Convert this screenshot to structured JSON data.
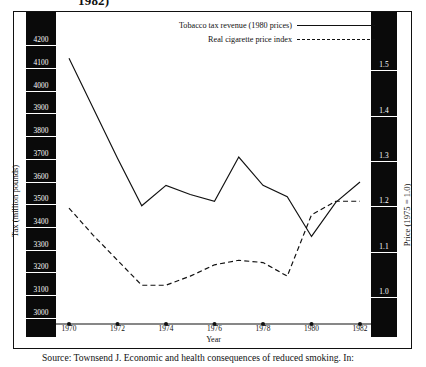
{
  "figure": {
    "title_fragment": "1982)",
    "source": "Source: Townsend J. Economic and health consequences of reduced smoking. In:"
  },
  "legend": {
    "position": "top-center",
    "entries": [
      {
        "label": "Tobacco tax revenue (1980 prices)",
        "style": "solid"
      },
      {
        "label": "Real cigarette price index",
        "style": "dashed"
      }
    ]
  },
  "axes": {
    "x": {
      "label": "Year",
      "ticks": [
        "1970",
        "1972",
        "1974",
        "1976",
        "1978",
        "1980",
        "1982"
      ],
      "min": 1970,
      "max": 1982
    },
    "y_left": {
      "label": "Tax (million pounds)",
      "ticks": [
        "4200",
        "4100",
        "4000",
        "3900",
        "3800",
        "3700",
        "3600",
        "3500",
        "3400",
        "3300",
        "3200",
        "3100",
        "3000"
      ],
      "min": 2950,
      "max": 4250
    },
    "y_right": {
      "label": "Price (1975 = 1.0)",
      "ticks": [
        "1.5",
        "1.4",
        "1.3",
        "1.2",
        "1.1",
        "1.0"
      ],
      "min": 0.93,
      "max": 1.58
    }
  },
  "chart_data": {
    "type": "line",
    "xlabel": "Year",
    "ylabel": "Tax (million pounds)",
    "ylabel_secondary": "Price (1975 = 1.0)",
    "grid": false,
    "legend_position": "top-center",
    "x": [
      1970,
      1971,
      1972,
      1973,
      1974,
      1975,
      1976,
      1977,
      1978,
      1979,
      1980,
      1981,
      1982
    ],
    "xlim": [
      1970,
      1982
    ],
    "ylim": [
      2950,
      4250
    ],
    "ylim_secondary": [
      0.93,
      1.58
    ],
    "series": [
      {
        "name": "Tobacco tax revenue (1980 prices)",
        "axis": "left",
        "style": "solid",
        "color": "#111111",
        "values": [
          4090,
          3870,
          3650,
          3440,
          3530,
          3490,
          3460,
          3655,
          3530,
          3480,
          3305,
          3455,
          3545
        ]
      },
      {
        "name": "Real cigarette price index",
        "axis": "right",
        "style": "dashed",
        "color": "#111111",
        "values": [
          1.17,
          1.11,
          1.055,
          1.0,
          1.0,
          1.02,
          1.045,
          1.055,
          1.05,
          1.02,
          1.155,
          1.185,
          1.185
        ]
      }
    ]
  }
}
